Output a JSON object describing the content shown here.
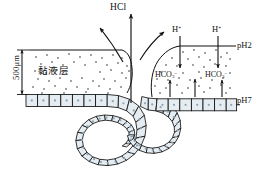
{
  "figure": {
    "labels": {
      "hcl": "HCl",
      "h_ion_left": "H",
      "h_ion_right": "H",
      "h_charge": "+",
      "bicarbonate_left_base": "HCO",
      "bicarbonate_left_sub": "3",
      "bicarbonate_left_sup": "−",
      "bicarbonate_right_base": "HCO",
      "bicarbonate_right_sub": "3",
      "bicarbonate_right_sup": "−",
      "ph_lumen": "pH2",
      "ph_cell_surface": "pH7",
      "mucus_layer": "黏液层",
      "thickness": "500μm"
    },
    "colors": {
      "stroke": "#111111",
      "cell_fill": "#e6edf2",
      "nucleus": "#8fa6b4",
      "mucus_dots": "#1a1a1a",
      "background": "#ffffff"
    },
    "elements": {
      "hcl_arrow_count": "3",
      "h_arrow_count": "2",
      "hco3_arrow_count": "3",
      "thickness_arrow": "double-headed-vertical"
    }
  }
}
